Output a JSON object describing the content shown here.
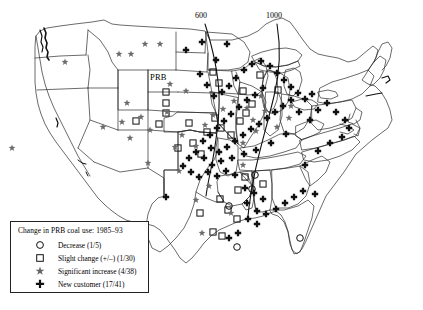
{
  "figure": {
    "name": "us-prb-coal-use-map",
    "prb_label": "PRB"
  },
  "isolines": [
    {
      "label": "600",
      "x": 200,
      "y": 13
    },
    {
      "label": "1000",
      "x": 271,
      "y": 13
    }
  ],
  "legend": {
    "title": "Change in PRB coal use: 1985–93",
    "items": [
      {
        "symbol": "circle",
        "label": "Decrease (1/5)"
      },
      {
        "symbol": "square",
        "label": "Slight change (+/–) (1/30)"
      },
      {
        "symbol": "star",
        "label": "Significant increase (4/38)"
      },
      {
        "symbol": "plus",
        "label": "New customer (17/41)"
      }
    ]
  },
  "chart_data": {
    "type": "scatter",
    "title": "Change in PRB coal use: 1985–93",
    "xlabel": "",
    "ylabel": "",
    "grid": false,
    "legend_position": "bottom-left",
    "projection": "contiguous-united-states",
    "annotations": [
      {
        "text": "PRB",
        "x": 160,
        "y": 78
      },
      {
        "text": "600",
        "x": 200,
        "y": 13
      },
      {
        "text": "1000",
        "x": 271,
        "y": 13
      }
    ],
    "series": [
      {
        "name": "Decrease (1/5)",
        "symbol": "circle",
        "count_label": "1/5",
        "points": [
          {
            "x": 255,
            "y": 175
          },
          {
            "x": 252,
            "y": 189
          },
          {
            "x": 229,
            "y": 206
          },
          {
            "x": 237,
            "y": 247
          },
          {
            "x": 300,
            "y": 238
          }
        ]
      },
      {
        "name": "Slight change (+/–) (1/30)",
        "symbol": "square",
        "count_label": "1/30",
        "points": [
          {
            "x": 166,
            "y": 92
          },
          {
            "x": 166,
            "y": 103
          },
          {
            "x": 166,
            "y": 113
          },
          {
            "x": 136,
            "y": 121
          },
          {
            "x": 159,
            "y": 124
          },
          {
            "x": 189,
            "y": 123
          },
          {
            "x": 207,
            "y": 132
          },
          {
            "x": 221,
            "y": 128
          },
          {
            "x": 215,
            "y": 118
          },
          {
            "x": 231,
            "y": 135
          },
          {
            "x": 240,
            "y": 121
          },
          {
            "x": 246,
            "y": 113
          },
          {
            "x": 252,
            "y": 104
          },
          {
            "x": 243,
            "y": 91
          },
          {
            "x": 219,
            "y": 83
          },
          {
            "x": 213,
            "y": 72
          },
          {
            "x": 260,
            "y": 75
          },
          {
            "x": 278,
            "y": 90
          },
          {
            "x": 193,
            "y": 143
          },
          {
            "x": 201,
            "y": 154
          },
          {
            "x": 178,
            "y": 148
          },
          {
            "x": 220,
            "y": 199
          },
          {
            "x": 228,
            "y": 210
          },
          {
            "x": 237,
            "y": 219
          },
          {
            "x": 213,
            "y": 232
          },
          {
            "x": 222,
            "y": 236
          },
          {
            "x": 200,
            "y": 213
          },
          {
            "x": 238,
            "y": 190
          },
          {
            "x": 245,
            "y": 177
          },
          {
            "x": 263,
            "y": 184
          }
        ]
      },
      {
        "name": "Significant increase (4/38)",
        "symbol": "star",
        "count_label": "4/38",
        "points": [
          {
            "x": 65,
            "y": 62
          },
          {
            "x": 119,
            "y": 54
          },
          {
            "x": 131,
            "y": 54
          },
          {
            "x": 145,
            "y": 44
          },
          {
            "x": 160,
            "y": 44
          },
          {
            "x": 127,
            "y": 103
          },
          {
            "x": 130,
            "y": 138
          },
          {
            "x": 12,
            "y": 148
          },
          {
            "x": 150,
            "y": 130
          },
          {
            "x": 148,
            "y": 163
          },
          {
            "x": 175,
            "y": 147
          },
          {
            "x": 182,
            "y": 135
          },
          {
            "x": 179,
            "y": 171
          },
          {
            "x": 196,
            "y": 146
          },
          {
            "x": 205,
            "y": 125
          },
          {
            "x": 213,
            "y": 115
          },
          {
            "x": 223,
            "y": 109
          },
          {
            "x": 234,
            "y": 101
          },
          {
            "x": 247,
            "y": 108
          },
          {
            "x": 261,
            "y": 96
          },
          {
            "x": 196,
            "y": 200
          },
          {
            "x": 202,
            "y": 233
          },
          {
            "x": 231,
            "y": 213
          },
          {
            "x": 253,
            "y": 120
          },
          {
            "x": 289,
            "y": 118
          },
          {
            "x": 291,
            "y": 106
          },
          {
            "x": 167,
            "y": 112
          },
          {
            "x": 141,
            "y": 117
          },
          {
            "x": 122,
            "y": 122
          },
          {
            "x": 103,
            "y": 127
          },
          {
            "x": 170,
            "y": 84
          },
          {
            "x": 186,
            "y": 91
          },
          {
            "x": 256,
            "y": 131
          },
          {
            "x": 243,
            "y": 143
          },
          {
            "x": 209,
            "y": 186
          },
          {
            "x": 243,
            "y": 165
          },
          {
            "x": 265,
            "y": 111
          },
          {
            "x": 277,
            "y": 127
          }
        ]
      },
      {
        "name": "New customer (17/41)",
        "symbol": "plus",
        "count_label": "17/41",
        "points": [
          {
            "x": 186,
            "y": 50
          },
          {
            "x": 202,
            "y": 42
          },
          {
            "x": 227,
            "y": 44
          },
          {
            "x": 216,
            "y": 60
          },
          {
            "x": 200,
            "y": 74
          },
          {
            "x": 207,
            "y": 85
          },
          {
            "x": 214,
            "y": 96
          },
          {
            "x": 222,
            "y": 92
          },
          {
            "x": 229,
            "y": 86
          },
          {
            "x": 236,
            "y": 78
          },
          {
            "x": 244,
            "y": 70
          },
          {
            "x": 252,
            "y": 64
          },
          {
            "x": 261,
            "y": 61
          },
          {
            "x": 270,
            "y": 66
          },
          {
            "x": 277,
            "y": 73
          },
          {
            "x": 284,
            "y": 80
          },
          {
            "x": 291,
            "y": 87
          },
          {
            "x": 298,
            "y": 93
          },
          {
            "x": 305,
            "y": 99
          },
          {
            "x": 312,
            "y": 94
          },
          {
            "x": 263,
            "y": 88
          },
          {
            "x": 255,
            "y": 95
          },
          {
            "x": 247,
            "y": 100
          },
          {
            "x": 239,
            "y": 107
          },
          {
            "x": 231,
            "y": 114
          },
          {
            "x": 224,
            "y": 121
          },
          {
            "x": 217,
            "y": 128
          },
          {
            "x": 210,
            "y": 135
          },
          {
            "x": 203,
            "y": 141
          },
          {
            "x": 211,
            "y": 148
          },
          {
            "x": 219,
            "y": 152
          },
          {
            "x": 227,
            "y": 147
          },
          {
            "x": 235,
            "y": 141
          },
          {
            "x": 243,
            "y": 135
          },
          {
            "x": 251,
            "y": 129
          },
          {
            "x": 259,
            "y": 124
          },
          {
            "x": 267,
            "y": 118
          },
          {
            "x": 275,
            "y": 112
          },
          {
            "x": 283,
            "y": 106
          },
          {
            "x": 291,
            "y": 100
          },
          {
            "x": 299,
            "y": 112
          },
          {
            "x": 286,
            "y": 134
          },
          {
            "x": 271,
            "y": 143
          },
          {
            "x": 256,
            "y": 150
          },
          {
            "x": 244,
            "y": 154
          },
          {
            "x": 232,
            "y": 158
          },
          {
            "x": 221,
            "y": 161
          },
          {
            "x": 212,
            "y": 165
          },
          {
            "x": 204,
            "y": 158
          },
          {
            "x": 196,
            "y": 152
          },
          {
            "x": 189,
            "y": 158
          },
          {
            "x": 183,
            "y": 166
          },
          {
            "x": 191,
            "y": 172
          },
          {
            "x": 199,
            "y": 177
          },
          {
            "x": 208,
            "y": 172
          },
          {
            "x": 217,
            "y": 176
          },
          {
            "x": 226,
            "y": 171
          },
          {
            "x": 235,
            "y": 175
          },
          {
            "x": 245,
            "y": 188
          },
          {
            "x": 254,
            "y": 193
          },
          {
            "x": 263,
            "y": 199
          },
          {
            "x": 247,
            "y": 203
          },
          {
            "x": 257,
            "y": 211
          },
          {
            "x": 266,
            "y": 214
          },
          {
            "x": 276,
            "y": 209
          },
          {
            "x": 285,
            "y": 203
          },
          {
            "x": 294,
            "y": 197
          },
          {
            "x": 303,
            "y": 191
          },
          {
            "x": 315,
            "y": 194
          },
          {
            "x": 166,
            "y": 197
          },
          {
            "x": 248,
            "y": 219
          },
          {
            "x": 257,
            "y": 224
          },
          {
            "x": 238,
            "y": 233
          },
          {
            "x": 229,
            "y": 238
          },
          {
            "x": 305,
            "y": 165
          },
          {
            "x": 318,
            "y": 151
          },
          {
            "x": 330,
            "y": 143
          },
          {
            "x": 342,
            "y": 137
          },
          {
            "x": 349,
            "y": 128
          },
          {
            "x": 310,
            "y": 120
          },
          {
            "x": 318,
            "y": 110
          },
          {
            "x": 327,
            "y": 103
          },
          {
            "x": 336,
            "y": 112
          },
          {
            "x": 345,
            "y": 120
          }
        ]
      }
    ]
  }
}
